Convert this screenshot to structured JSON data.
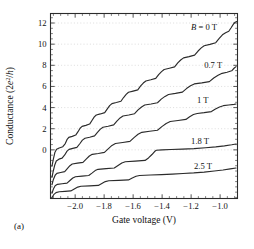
{
  "figure": {
    "panel_label": "(a)",
    "background": "#ffffff",
    "frame_color": "#2b2b2b",
    "grid_color": "#cfcfcf",
    "curve_color": "#2b2b2b"
  },
  "chart_data": {
    "type": "line",
    "title": "",
    "xlabel": "Gate voltage (V)",
    "ylabel": "Conductance (2e²/h)",
    "ylabel_parts": {
      "pre": "Conductance (2",
      "ital": "e",
      "sup": "2",
      "mid": "/",
      "ital2": "h",
      "post": ")"
    },
    "xlim": [
      -2.17,
      -0.88
    ],
    "ylim": [
      -4.6,
      12.9
    ],
    "xticks": [
      -2.0,
      -1.8,
      -1.6,
      -1.4,
      -1.2,
      -1.0
    ],
    "xticklabels": [
      "−2.0",
      "−1.8",
      "−1.6",
      "−1.4",
      "−1.2",
      "−1.0"
    ],
    "yticks": [
      0,
      2,
      4,
      6,
      8,
      10,
      12
    ],
    "yticklabels": [
      "0",
      "2",
      "4",
      "6",
      "8",
      "10",
      "12"
    ],
    "xminor_step": 0.05,
    "yminor_step": 0.5,
    "grid": "horizontal-dotted-at-yticks",
    "legend": "inline-annotations",
    "ticks_all_sides": true,
    "annotations": [
      {
        "text": "B = 0 T",
        "ital_first": true,
        "x": -1.2,
        "y": 11.35
      },
      {
        "text": "0.7 T",
        "ital_first": false,
        "x": -1.11,
        "y": 7.75
      },
      {
        "text": "1 T",
        "ital_first": false,
        "x": -1.16,
        "y": 4.45
      },
      {
        "text": "1.8 T",
        "ital_first": false,
        "x": -1.2,
        "y": 0.55
      },
      {
        "text": "2.5 T",
        "ital_first": false,
        "x": -1.18,
        "y": -1.85
      }
    ],
    "series": [
      {
        "name": "B = 0 T",
        "label": "B = 0 T",
        "field_tesla": 0,
        "offset": 0,
        "points": [
          [
            -2.16,
            -1.55
          ],
          [
            -2.15,
            -0.85
          ],
          [
            -2.14,
            -0.25
          ],
          [
            -2.128,
            0.05
          ],
          [
            -2.11,
            0.18
          ],
          [
            -2.085,
            0.3
          ],
          [
            -2.068,
            0.6
          ],
          [
            -2.055,
            1.0
          ],
          [
            -2.044,
            1.18
          ],
          [
            -2.02,
            1.28
          ],
          [
            -1.996,
            1.4
          ],
          [
            -1.98,
            1.72
          ],
          [
            -1.966,
            2.05
          ],
          [
            -1.952,
            2.22
          ],
          [
            -1.926,
            2.32
          ],
          [
            -1.9,
            2.44
          ],
          [
            -1.884,
            2.78
          ],
          [
            -1.868,
            3.12
          ],
          [
            -1.854,
            3.3
          ],
          [
            -1.826,
            3.4
          ],
          [
            -1.796,
            3.52
          ],
          [
            -1.778,
            3.88
          ],
          [
            -1.762,
            4.18
          ],
          [
            -1.746,
            4.38
          ],
          [
            -1.716,
            4.48
          ],
          [
            -1.684,
            4.6
          ],
          [
            -1.666,
            4.95
          ],
          [
            -1.648,
            5.25
          ],
          [
            -1.632,
            5.45
          ],
          [
            -1.6,
            5.56
          ],
          [
            -1.568,
            5.68
          ],
          [
            -1.548,
            6.05
          ],
          [
            -1.53,
            6.32
          ],
          [
            -1.512,
            6.52
          ],
          [
            -1.478,
            6.63
          ],
          [
            -1.444,
            6.76
          ],
          [
            -1.424,
            7.12
          ],
          [
            -1.404,
            7.4
          ],
          [
            -1.386,
            7.6
          ],
          [
            -1.35,
            7.72
          ],
          [
            -1.314,
            7.85
          ],
          [
            -1.292,
            8.22
          ],
          [
            -1.272,
            8.5
          ],
          [
            -1.252,
            8.7
          ],
          [
            -1.214,
            8.82
          ],
          [
            -1.176,
            8.96
          ],
          [
            -1.152,
            9.35
          ],
          [
            -1.13,
            9.65
          ],
          [
            -1.11,
            9.85
          ],
          [
            -1.07,
            9.98
          ],
          [
            -1.03,
            10.14
          ],
          [
            -1.006,
            10.55
          ],
          [
            -0.984,
            10.88
          ],
          [
            -0.962,
            11.08
          ],
          [
            -0.94,
            11.22
          ],
          [
            -0.924,
            11.55
          ],
          [
            -0.908,
            11.9
          ],
          [
            -0.896,
            12.08
          ],
          [
            -0.886,
            12.14
          ]
        ]
      },
      {
        "name": "0.7 T",
        "label": "0.7 T",
        "field_tesla": 0.7,
        "offset": 0,
        "points": [
          [
            -2.16,
            -2.6
          ],
          [
            -2.15,
            -1.95
          ],
          [
            -2.14,
            -1.4
          ],
          [
            -2.13,
            -1.05
          ],
          [
            -2.112,
            -0.88
          ],
          [
            -2.09,
            -0.78
          ],
          [
            -2.072,
            -0.48
          ],
          [
            -2.056,
            -0.12
          ],
          [
            -2.042,
            0.05
          ],
          [
            -2.016,
            0.14
          ],
          [
            -1.988,
            0.24
          ],
          [
            -1.968,
            0.58
          ],
          [
            -1.95,
            0.92
          ],
          [
            -1.932,
            1.1
          ],
          [
            -1.9,
            1.2
          ],
          [
            -1.866,
            1.32
          ],
          [
            -1.846,
            1.66
          ],
          [
            -1.826,
            1.96
          ],
          [
            -1.808,
            2.14
          ],
          [
            -1.772,
            2.24
          ],
          [
            -1.734,
            2.36
          ],
          [
            -1.712,
            2.72
          ],
          [
            -1.69,
            3.02
          ],
          [
            -1.67,
            3.2
          ],
          [
            -1.63,
            3.3
          ],
          [
            -1.59,
            3.42
          ],
          [
            -1.566,
            3.78
          ],
          [
            -1.542,
            4.06
          ],
          [
            -1.52,
            4.24
          ],
          [
            -1.476,
            4.34
          ],
          [
            -1.432,
            4.46
          ],
          [
            -1.406,
            4.8
          ],
          [
            -1.38,
            5.06
          ],
          [
            -1.356,
            5.24
          ],
          [
            -1.308,
            5.34
          ],
          [
            -1.26,
            5.46
          ],
          [
            -1.232,
            5.8
          ],
          [
            -1.204,
            6.06
          ],
          [
            -1.178,
            6.24
          ],
          [
            -1.126,
            6.34
          ],
          [
            -1.074,
            6.46
          ],
          [
            -1.044,
            6.8
          ],
          [
            -1.014,
            7.06
          ],
          [
            -0.986,
            7.24
          ],
          [
            -0.952,
            7.34
          ],
          [
            -0.92,
            7.48
          ],
          [
            -0.904,
            7.72
          ],
          [
            -0.89,
            7.88
          ]
        ]
      },
      {
        "name": "1 T",
        "label": "1 T",
        "field_tesla": 1,
        "offset": 0,
        "points": [
          [
            -2.16,
            -3.3
          ],
          [
            -2.15,
            -2.8
          ],
          [
            -2.138,
            -2.4
          ],
          [
            -2.126,
            -2.22
          ],
          [
            -2.1,
            -2.14
          ],
          [
            -2.072,
            -2.06
          ],
          [
            -2.054,
            -1.78
          ],
          [
            -2.036,
            -1.5
          ],
          [
            -2.02,
            -1.34
          ],
          [
            -1.984,
            -1.26
          ],
          [
            -1.946,
            -1.18
          ],
          [
            -1.924,
            -0.88
          ],
          [
            -1.902,
            -0.58
          ],
          [
            -1.882,
            -0.42
          ],
          [
            -1.84,
            -0.34
          ],
          [
            -1.798,
            -0.24
          ],
          [
            -1.772,
            0.1
          ],
          [
            -1.746,
            0.42
          ],
          [
            -1.722,
            0.6
          ],
          [
            -1.672,
            0.7
          ],
          [
            -1.622,
            0.8
          ],
          [
            -1.594,
            1.16
          ],
          [
            -1.566,
            1.48
          ],
          [
            -1.54,
            1.66
          ],
          [
            -1.486,
            1.76
          ],
          [
            -1.432,
            1.86
          ],
          [
            -1.402,
            2.2
          ],
          [
            -1.372,
            2.5
          ],
          [
            -1.344,
            2.68
          ],
          [
            -1.29,
            2.78
          ],
          [
            -1.236,
            2.88
          ],
          [
            -1.21,
            3.14
          ],
          [
            -1.184,
            3.34
          ],
          [
            -1.158,
            3.44
          ],
          [
            -1.11,
            3.52
          ],
          [
            -1.06,
            3.62
          ],
          [
            -1.032,
            3.86
          ],
          [
            -1.004,
            4.06
          ],
          [
            -0.978,
            4.18
          ],
          [
            -0.94,
            4.24
          ],
          [
            -0.904,
            4.3
          ],
          [
            -0.89,
            4.34
          ]
        ]
      },
      {
        "name": "1.8 T",
        "label": "1.8 T",
        "field_tesla": 1.8,
        "offset": 0,
        "points": [
          [
            -2.16,
            -4.1
          ],
          [
            -2.15,
            -3.7
          ],
          [
            -2.138,
            -3.4
          ],
          [
            -2.122,
            -3.26
          ],
          [
            -2.09,
            -3.2
          ],
          [
            -2.056,
            -3.14
          ],
          [
            -2.036,
            -2.9
          ],
          [
            -2.016,
            -2.66
          ],
          [
            -1.998,
            -2.54
          ],
          [
            -1.952,
            -2.48
          ],
          [
            -1.906,
            -2.42
          ],
          [
            -1.884,
            -2.2
          ],
          [
            -1.862,
            -1.96
          ],
          [
            -1.842,
            -1.84
          ],
          [
            -1.786,
            -1.78
          ],
          [
            -1.73,
            -1.72
          ],
          [
            -1.704,
            -1.48
          ],
          [
            -1.678,
            -1.24
          ],
          [
            -1.654,
            -1.12
          ],
          [
            -1.586,
            -1.06
          ],
          [
            -1.518,
            -1.0
          ],
          [
            -1.494,
            -0.76
          ],
          [
            -1.47,
            -0.44
          ],
          [
            -1.452,
            -0.16
          ],
          [
            -1.44,
            -0.04
          ],
          [
            -1.4,
            0.0
          ],
          [
            -1.34,
            0.03
          ],
          [
            -1.26,
            0.07
          ],
          [
            -1.18,
            0.12
          ],
          [
            -1.1,
            0.2
          ],
          [
            -1.03,
            0.28
          ],
          [
            -0.97,
            0.38
          ],
          [
            -0.92,
            0.48
          ],
          [
            -0.89,
            0.56
          ]
        ]
      },
      {
        "name": "2.5 T",
        "label": "2.5 T",
        "field_tesla": 2.5,
        "offset": 0,
        "points": [
          [
            -2.16,
            -4.5
          ],
          [
            -2.148,
            -4.24
          ],
          [
            -2.132,
            -4.04
          ],
          [
            -2.11,
            -3.96
          ],
          [
            -2.07,
            -3.92
          ],
          [
            -2.03,
            -3.88
          ],
          [
            -2.006,
            -3.7
          ],
          [
            -1.982,
            -3.52
          ],
          [
            -1.96,
            -3.44
          ],
          [
            -1.9,
            -3.4
          ],
          [
            -1.84,
            -3.36
          ],
          [
            -1.816,
            -3.18
          ],
          [
            -1.792,
            -3.0
          ],
          [
            -1.768,
            -2.92
          ],
          [
            -1.7,
            -2.88
          ],
          [
            -1.632,
            -2.84
          ],
          [
            -1.606,
            -2.66
          ],
          [
            -1.58,
            -2.5
          ],
          [
            -1.556,
            -2.42
          ],
          [
            -1.48,
            -2.38
          ],
          [
            -1.404,
            -2.34
          ],
          [
            -1.33,
            -2.3
          ],
          [
            -1.256,
            -2.24
          ],
          [
            -1.182,
            -2.18
          ],
          [
            -1.11,
            -2.1
          ],
          [
            -1.04,
            -2.0
          ],
          [
            -0.98,
            -1.9
          ],
          [
            -0.93,
            -1.8
          ],
          [
            -0.89,
            -1.72
          ]
        ]
      }
    ]
  }
}
